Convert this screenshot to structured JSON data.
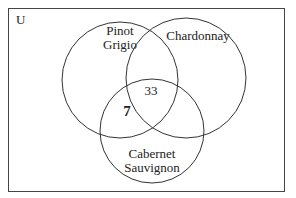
{
  "diagram": {
    "type": "venn",
    "universe_label": "U",
    "sets": [
      {
        "id": "pinot",
        "label_line1": "Pinot",
        "label_line2": "Grigio"
      },
      {
        "id": "chardonnay",
        "label_line1": "Chardonnay"
      },
      {
        "id": "cabernet",
        "label_line1": "Cabernet",
        "label_line2": "Sauvignon"
      }
    ],
    "regions": {
      "pinot_chardonnay_cabernet": "33",
      "pinot_cabernet_only": "7"
    },
    "colors": {
      "stroke": "#333333",
      "text": "#222222",
      "background": "#ffffff"
    }
  }
}
